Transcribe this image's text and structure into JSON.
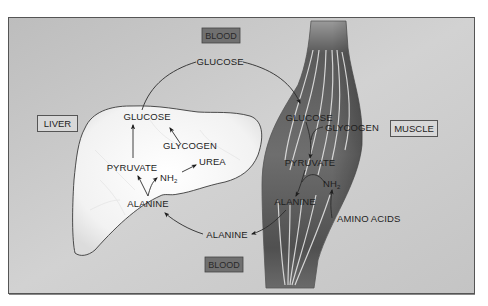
{
  "diagram": {
    "organs": {
      "liver": {
        "label": "LIVER"
      },
      "muscle": {
        "label": "MUSCLE"
      }
    },
    "blood": {
      "top_label": "BLOOD",
      "bottom_label": "BLOOD",
      "glucose_label": "GLUCOSE",
      "alanine_label": "ALANINE"
    },
    "liver_metabolites": {
      "glucose": "GLUCOSE",
      "glycogen": "GLYCOGEN",
      "pyruvate": "PYRUVATE",
      "nh2": "NH",
      "nh2_sub": "2",
      "urea": "UREA",
      "alanine": "ALANINE"
    },
    "muscle_metabolites": {
      "glucose": "GLUCOSE",
      "glycogen": "GLYCOGEN",
      "pyruvate": "PYRUVATE",
      "nh2": "NH",
      "nh2_sub": "2",
      "alanine": "ALANINE",
      "amino_acids": "AMINO ACIDS"
    },
    "colors": {
      "background_panel": "#c9c9c9",
      "liver_fill": "#f4f4f4",
      "muscle_dark": "#4a4a4a",
      "blood_box": "#6f6f6f",
      "label_box": "#d6d6d6",
      "line": "#2b2b2b"
    }
  }
}
